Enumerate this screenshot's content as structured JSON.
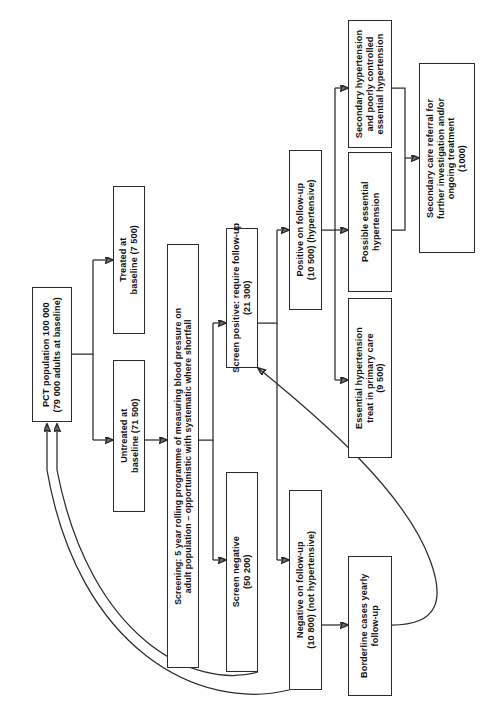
{
  "diagram": {
    "orientation": "rotated-90-ccw",
    "stroke_color": "#2b2b2b",
    "background_color": "#ffffff"
  },
  "nodes": {
    "pct_population": {
      "label": "PCT population 100 000\n(79 000 adults at baseline)",
      "count": "100 000",
      "sub_count": "79 000"
    },
    "treated_baseline": {
      "label": "Treated at\nbaseline (7 500)",
      "count": "7 500"
    },
    "untreated_baseline": {
      "label": "Untreated at\nbaseline (71 500)",
      "count": "71 500"
    },
    "screening": {
      "label": "Screening: 5 year rolling programme of measuring blood pressure on\nadult population – opportunistic with systematic where shortfall"
    },
    "screen_positive": {
      "label": "Screen positive: require follow-up\n(21 300)",
      "count": "21 300"
    },
    "screen_negative": {
      "label": "Screen negative\n(50 200)",
      "count": "50 200"
    },
    "positive_follow_up": {
      "label": "Positive on follow-up\n(10 500) (hypertensive)",
      "count": "10 500"
    },
    "negative_follow_up": {
      "label": "Negative on follow-up\n(10 800) (not hypertensive)",
      "count": "10 800"
    },
    "borderline_cases": {
      "label": "Borderline cases yearly\nfollow-up"
    },
    "essential_primary_care": {
      "label": "Essential hypertension\ntreat in primary care\n(9 500)",
      "count": "9 500"
    },
    "possible_essential": {
      "label": "Possible essential\nhypertension"
    },
    "secondary_poorly_controlled": {
      "label": "Secondary hypertension\nand poorly controlled\nessential hypertension"
    },
    "secondary_care_referral": {
      "label": "Secondary care referral for\nfurther investigation and/or\nongoing treatment\n(1000)",
      "count": "1000"
    }
  },
  "edges": [
    {
      "id": "pct-to-treated",
      "from": "pct_population",
      "to": "treated_baseline",
      "style": "elbow-arrow"
    },
    {
      "id": "pct-to-untreated",
      "from": "pct_population",
      "to": "untreated_baseline",
      "style": "elbow-arrow"
    },
    {
      "id": "untreated-to-screening",
      "from": "untreated_baseline",
      "to": "screening",
      "style": "straight-arrow"
    },
    {
      "id": "screening-to-screen-positive",
      "from": "screening",
      "to": "screen_positive",
      "style": "elbow-arrow"
    },
    {
      "id": "screening-to-screen-negative",
      "from": "screening",
      "to": "screen_negative",
      "style": "elbow-arrow"
    },
    {
      "id": "screen-positive-to-positive-follow-up",
      "from": "screen_positive",
      "to": "positive_follow_up",
      "style": "elbow-arrow"
    },
    {
      "id": "screen-positive-to-negative-follow-up",
      "from": "screen_positive",
      "to": "negative_follow_up",
      "style": "elbow-arrow"
    },
    {
      "id": "positive-follow-up-to-essential-primary-care",
      "from": "positive_follow_up",
      "to": "essential_primary_care",
      "style": "elbow-arrow"
    },
    {
      "id": "positive-follow-up-to-possible-essential",
      "from": "positive_follow_up",
      "to": "possible_essential",
      "style": "elbow-arrow"
    },
    {
      "id": "positive-follow-up-to-secondary-poorly-controlled",
      "from": "positive_follow_up",
      "to": "secondary_poorly_controlled",
      "style": "elbow-arrow"
    },
    {
      "id": "possible-and-secondary-to-referral",
      "from": "possible_essential",
      "to": "secondary_care_referral",
      "style": "merge-arrow"
    },
    {
      "id": "negative-follow-up-to-borderline",
      "from": "negative_follow_up",
      "to": "borderline_cases",
      "style": "straight-arrow"
    },
    {
      "id": "borderline-to-screen-positive",
      "from": "borderline_cases",
      "to": "screen_positive",
      "style": "curved-arrow"
    },
    {
      "id": "screen-negative-to-pct",
      "from": "screen_negative",
      "to": "pct_population",
      "style": "curved-feedback-arrow"
    },
    {
      "id": "negative-follow-up-to-pct",
      "from": "negative_follow_up",
      "to": "pct_population",
      "style": "curved-feedback-arrow"
    }
  ]
}
